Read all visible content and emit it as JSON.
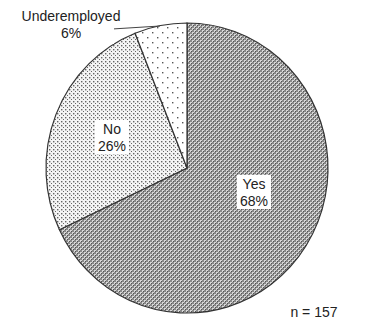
{
  "chart_data": {
    "type": "pie",
    "title": "",
    "categories": [
      "Yes",
      "No",
      "Underemployed"
    ],
    "values": [
      68,
      26,
      6
    ],
    "labels": [
      "68%",
      "26%",
      "6%"
    ],
    "start_angle": "12 o'clock, clockwise",
    "annotation": "n = 157",
    "legend": "none (direct labels)"
  },
  "labels": {
    "yes_name": "Yes",
    "yes_pct": "68%",
    "no_name": "No",
    "no_pct": "26%",
    "under_name": "Underemployed",
    "under_pct": "6%",
    "n_note": "n = 157"
  }
}
